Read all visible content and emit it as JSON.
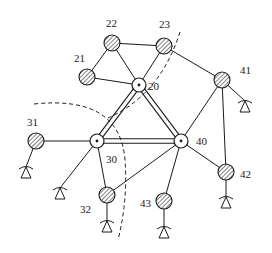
{
  "diagram": {
    "type": "network-topology",
    "colors": {
      "stroke": "#1a1a1a",
      "background": "#ffffff",
      "hatch": "#1a1a1a"
    },
    "hub_nodes": [
      {
        "id": "20",
        "label": "20",
        "x": 139,
        "y": 85,
        "label_x": 148,
        "label_y": 90
      },
      {
        "id": "30",
        "label": "30",
        "x": 97,
        "y": 141,
        "label_x": 106,
        "label_y": 163
      },
      {
        "id": "40",
        "label": "40",
        "x": 181,
        "y": 141,
        "label_x": 196,
        "label_y": 145
      }
    ],
    "leaf_nodes": [
      {
        "id": "21",
        "label": "21",
        "x": 87,
        "y": 77,
        "label_x": 74,
        "label_y": 62,
        "terminal": false
      },
      {
        "id": "22",
        "label": "22",
        "x": 112,
        "y": 43,
        "label_x": 106,
        "label_y": 27,
        "terminal": false
      },
      {
        "id": "23",
        "label": "23",
        "x": 164,
        "y": 46,
        "label_x": 159,
        "label_y": 28,
        "terminal": false
      },
      {
        "id": "31",
        "label": "31",
        "x": 36,
        "y": 141,
        "label_x": 27,
        "label_y": 126,
        "terminal": true,
        "tx": 26,
        "ty": 170
      },
      {
        "id": "32",
        "label": "32",
        "x": 107,
        "y": 195,
        "label_x": 80,
        "label_y": 213,
        "terminal": true,
        "tx": 107,
        "ty": 224
      },
      {
        "id": "41",
        "label": "41",
        "x": 222,
        "y": 80,
        "label_x": 240,
        "label_y": 74,
        "terminal": true,
        "tx": 245,
        "ty": 104
      },
      {
        "id": "42",
        "label": "42",
        "x": 226,
        "y": 172,
        "label_x": 240,
        "label_y": 178,
        "terminal": true,
        "tx": 226,
        "ty": 200
      },
      {
        "id": "43",
        "label": "43",
        "x": 164,
        "y": 201,
        "label_x": 140,
        "label_y": 207,
        "terminal": true,
        "tx": 164,
        "ty": 230
      }
    ],
    "extra_terminals": [
      {
        "id": "t30",
        "from": "30",
        "tx": 60,
        "ty": 191
      }
    ],
    "trunk_links": [
      [
        "20",
        "30"
      ],
      [
        "20",
        "40"
      ],
      [
        "30",
        "40"
      ]
    ],
    "links": [
      [
        "21",
        "22"
      ],
      [
        "21",
        "20"
      ],
      [
        "22",
        "23"
      ],
      [
        "22",
        "20"
      ],
      [
        "23",
        "20"
      ],
      [
        "23",
        "41"
      ],
      [
        "31",
        "30"
      ],
      [
        "30",
        "32"
      ],
      [
        "40",
        "32"
      ],
      [
        "40",
        "43"
      ],
      [
        "40",
        "41"
      ],
      [
        "40",
        "42"
      ],
      [
        "41",
        "42"
      ]
    ],
    "dashed_boundaries": [
      {
        "name": "boundary-20-40",
        "path": "M 180 32 Q 160 95 108 118"
      },
      {
        "name": "boundary-30",
        "path": "M 34 104 Q 120 95 125 160 Q 128 200 118 240"
      }
    ]
  }
}
